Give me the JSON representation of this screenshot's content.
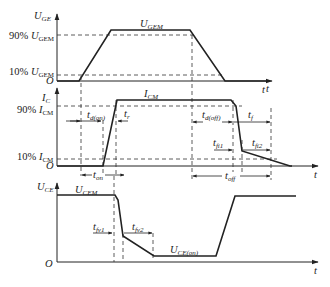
{
  "panels": {
    "gate_voltage": {
      "y_axis": {
        "symbol": "U",
        "subscript": "GE"
      },
      "x_axis": {
        "symbol": "t"
      },
      "origin": "O",
      "levels": {
        "peak": {
          "symbol": "U",
          "subscript": "GEM"
        },
        "p90": {
          "prefix": "90% ",
          "symbol": "U",
          "subscript": "GEM"
        },
        "p10": {
          "prefix": "10% ",
          "symbol": "U",
          "subscript": "GEM"
        }
      }
    },
    "collector_current": {
      "y_axis": {
        "symbol": "I",
        "subscript": "C"
      },
      "x_axis": {
        "symbol": "t"
      },
      "origin": "O",
      "levels": {
        "peak": {
          "symbol": "I",
          "subscript": "CM"
        },
        "p90": {
          "prefix": "90% ",
          "symbol": "I",
          "subscript": "CM"
        },
        "p10": {
          "prefix": "10% ",
          "symbol": "I",
          "subscript": "CM"
        }
      },
      "intervals": {
        "td_on": {
          "symbol": "t",
          "subscript": "d(on)"
        },
        "tr": {
          "symbol": "t",
          "subscript": "r"
        },
        "ton": {
          "symbol": "t",
          "subscript": "on"
        },
        "td_off": {
          "symbol": "t",
          "subscript": "d(off)"
        },
        "tf": {
          "symbol": "t",
          "subscript": "f"
        },
        "tfi1": {
          "symbol": "t",
          "subscript": "fi1"
        },
        "tfi2": {
          "symbol": "t",
          "subscript": "fi2"
        },
        "toff": {
          "symbol": "t",
          "subscript": "off"
        }
      }
    },
    "collector_emitter_voltage": {
      "y_axis": {
        "symbol": "U",
        "subscript": "CE"
      },
      "x_axis": {
        "symbol": "t"
      },
      "origin": "O",
      "levels": {
        "peak": {
          "symbol": "U",
          "subscript": "CEM"
        },
        "on": {
          "symbol": "U",
          "subscript": "CE(on)"
        }
      },
      "intervals": {
        "tfv1": {
          "symbol": "t",
          "subscript": "fv1"
        },
        "tfv2": {
          "symbol": "t",
          "subscript": "fv2"
        }
      }
    }
  }
}
